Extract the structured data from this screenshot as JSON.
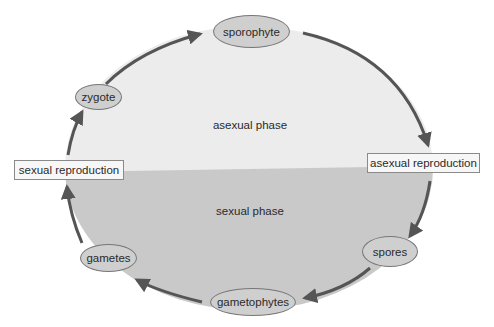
{
  "diagram": {
    "type": "life-cycle",
    "direction": "clockwise",
    "phases": {
      "upper": "asexual phase",
      "lower": "sexual phase"
    },
    "stages": [
      {
        "id": "sporophyte",
        "label": "sporophyte"
      },
      {
        "id": "spores",
        "label": "spores"
      },
      {
        "id": "gametophytes",
        "label": "gametophytes"
      },
      {
        "id": "gametes",
        "label": "gametes"
      },
      {
        "id": "zygote",
        "label": "zygote"
      }
    ],
    "processes": [
      {
        "id": "asexual-reproduction",
        "label": "asexual reproduction"
      },
      {
        "id": "sexual-reproduction",
        "label": "sexual reproduction"
      }
    ],
    "edges": [
      [
        "zygote",
        "sporophyte"
      ],
      [
        "sporophyte",
        "asexual-reproduction"
      ],
      [
        "asexual-reproduction",
        "spores"
      ],
      [
        "spores",
        "gametophytes"
      ],
      [
        "gametophytes",
        "gametes"
      ],
      [
        "gametes",
        "sexual-reproduction"
      ],
      [
        "sexual-reproduction",
        "zygote"
      ]
    ],
    "colors": {
      "upper_fill": "#ececec",
      "lower_fill": "#c9c9c9",
      "arrow": "#555555",
      "oval_fill": "#cfcfcf",
      "box_fill": "#f7f7f7"
    }
  }
}
